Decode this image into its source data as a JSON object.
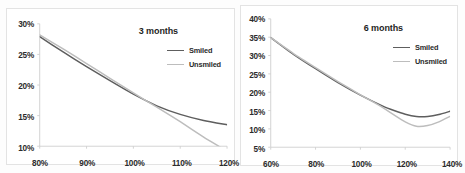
{
  "figure": {
    "background": "#fdfdfd",
    "panel_border": "#e3e3e3"
  },
  "series_colors": {
    "smiled": "#5e5e5e",
    "unsmiled": "#bdbdbd"
  },
  "chart_data": [
    {
      "type": "line",
      "title": "3 months",
      "xlabel": "",
      "ylabel": "",
      "xlim": [
        80,
        120
      ],
      "ylim": [
        10,
        30
      ],
      "xticks": [
        80,
        90,
        100,
        110,
        120
      ],
      "xticklabels": [
        "80%",
        "90%",
        "100%",
        "110%",
        "120%"
      ],
      "yticks": [
        10,
        15,
        20,
        25,
        30
      ],
      "yticklabels": [
        "10%",
        "15%",
        "20%",
        "25%",
        "30%"
      ],
      "grid": false,
      "legend_position": "upper-right",
      "series": [
        {
          "name": "Smiled",
          "color": "#5e5e5e",
          "x": [
            80,
            85,
            90,
            95,
            100,
            105,
            110,
            115,
            120
          ],
          "values": [
            27.9,
            25.4,
            23.0,
            20.7,
            18.5,
            16.6,
            15.2,
            14.2,
            13.5
          ]
        },
        {
          "name": "Unsmiled",
          "color": "#bdbdbd",
          "x": [
            80,
            85,
            90,
            95,
            100,
            105,
            110,
            115,
            118.5
          ],
          "values": [
            28.2,
            25.9,
            23.5,
            21.1,
            18.7,
            16.4,
            14.0,
            11.5,
            9.9
          ]
        }
      ]
    },
    {
      "type": "line",
      "title": "6 months",
      "xlabel": "",
      "ylabel": "",
      "xlim": [
        60,
        140
      ],
      "ylim": [
        5,
        40
      ],
      "xticks": [
        60,
        80,
        100,
        120,
        140
      ],
      "xticklabels": [
        "60%",
        "80%",
        "100%",
        "120%",
        "140%"
      ],
      "yticks": [
        5,
        10,
        15,
        20,
        25,
        30,
        35,
        40
      ],
      "yticklabels": [
        "5%",
        "10%",
        "15%",
        "20%",
        "25%",
        "30%",
        "35%",
        "40%"
      ],
      "grid": false,
      "legend_position": "upper-right",
      "series": [
        {
          "name": "Smiled",
          "color": "#5e5e5e",
          "x": [
            60,
            70,
            80,
            90,
            100,
            110,
            115,
            120,
            125,
            130,
            135,
            140
          ],
          "values": [
            34.9,
            30.4,
            26.4,
            22.6,
            19.2,
            16.2,
            15.0,
            14.0,
            13.4,
            13.4,
            13.9,
            14.8
          ]
        },
        {
          "name": "Unsmiled",
          "color": "#bdbdbd",
          "x": [
            60,
            70,
            80,
            90,
            100,
            110,
            115,
            120,
            125,
            130,
            135,
            140
          ],
          "values": [
            34.9,
            30.6,
            26.7,
            22.9,
            19.3,
            15.8,
            13.8,
            11.9,
            10.7,
            10.9,
            11.9,
            13.4
          ]
        }
      ]
    }
  ]
}
